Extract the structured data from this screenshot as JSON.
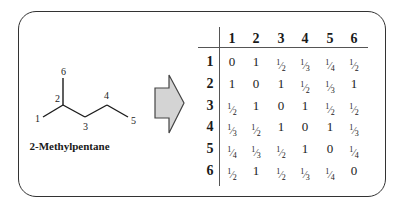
{
  "molecule": {
    "name": "2-Methylpentane",
    "atom_labels": [
      "1",
      "2",
      "3",
      "4",
      "5",
      "6"
    ],
    "bonds": [
      [
        1,
        2
      ],
      [
        2,
        3
      ],
      [
        3,
        4
      ],
      [
        4,
        5
      ],
      [
        2,
        6
      ]
    ]
  },
  "arrow": {
    "fill": "#d4d4d4",
    "stroke": "#444444",
    "direction": "right"
  },
  "matrix": {
    "column_headers": [
      "1",
      "2",
      "3",
      "4",
      "5",
      "6"
    ],
    "row_headers": [
      "1",
      "2",
      "3",
      "4",
      "5",
      "6"
    ],
    "rows": [
      [
        "0",
        "1",
        "1/2",
        "1/3",
        "1/4",
        "1/2"
      ],
      [
        "1",
        "0",
        "1",
        "1/2",
        "1/3",
        "1"
      ],
      [
        "1/2",
        "1",
        "0",
        "1",
        "1/2",
        "1/2"
      ],
      [
        "1/3",
        "1/2",
        "1",
        "0",
        "1",
        "1/3"
      ],
      [
        "1/4",
        "1/3",
        "1/2",
        "1",
        "0",
        "1/4"
      ],
      [
        "1/2",
        "1",
        "1/2",
        "1/3",
        "1/4",
        "0"
      ]
    ]
  }
}
